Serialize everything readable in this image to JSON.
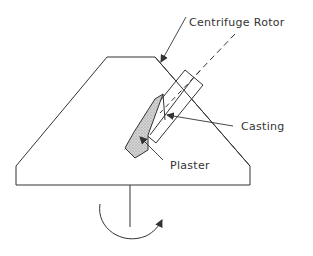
{
  "diagram": {
    "labels": {
      "rotor": "Centrifuge Rotor",
      "casting": "Casting",
      "plaster": "Plaster"
    },
    "colors": {
      "line": "#333333",
      "plaster_fill": "#c8c8c8",
      "background": "#ffffff"
    }
  }
}
